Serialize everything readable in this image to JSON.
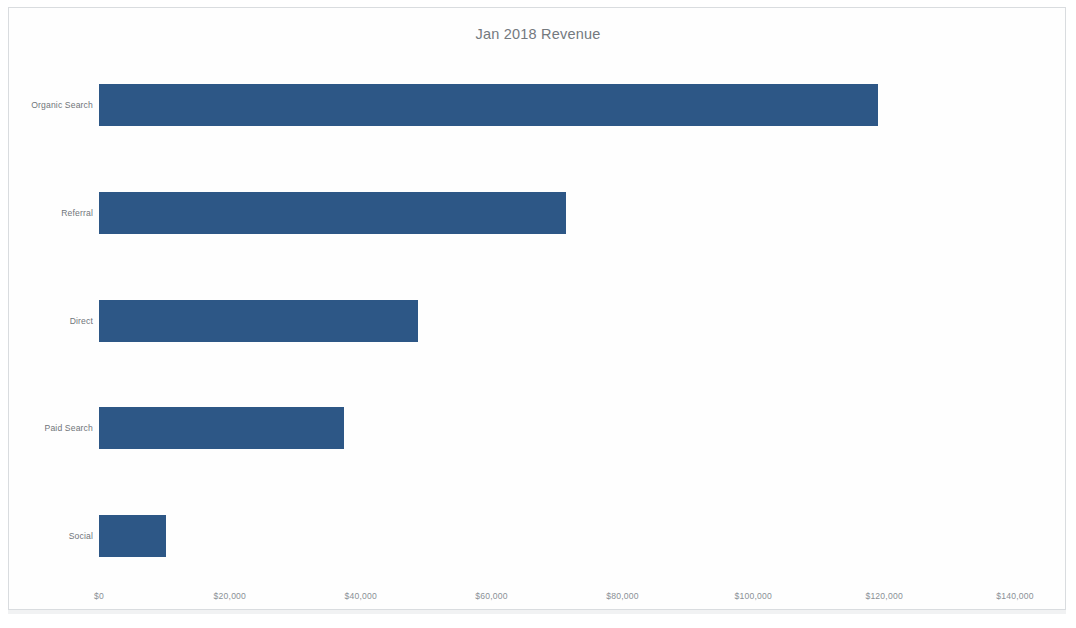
{
  "chart_data": {
    "type": "bar",
    "orientation": "horizontal",
    "title": "Jan 2018 Revenue",
    "xlabel": "",
    "ylabel": "",
    "categories": [
      "Organic Search",
      "Referral",
      "Direct",
      "Paid Search",
      "Social"
    ],
    "values": [
      119000,
      71400,
      48800,
      37500,
      10200
    ],
    "series": [
      {
        "name": "Revenue",
        "values": [
          119000,
          71400,
          48800,
          37500,
          10200
        ]
      }
    ],
    "xlim": [
      0,
      140000
    ],
    "xticks": [
      0,
      20000,
      40000,
      60000,
      80000,
      100000,
      120000,
      140000
    ],
    "xtick_labels": [
      "$0",
      "$20,000",
      "$40,000",
      "$60,000",
      "$80,000",
      "$100,000",
      "$120,000",
      "$140,000"
    ],
    "grid": false,
    "legend": false,
    "legend_position": "none",
    "bar_color": "#2d5786",
    "title_color": "#74797e",
    "label_color": "#70757a",
    "tick_color": "#8a9096",
    "background_color": "#ffffff"
  }
}
